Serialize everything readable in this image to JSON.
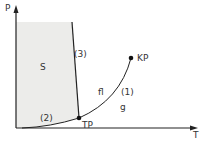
{
  "diagram": {
    "type": "phase diagram",
    "axes": {
      "y_label": "P",
      "x_label": "T"
    },
    "regions": {
      "solid": "S",
      "liquid": "fl",
      "gas": "g"
    },
    "curves": {
      "vaporization": "(1)",
      "sublimation": "(2)",
      "melting": "(3)"
    },
    "points": {
      "triple_point": "TP",
      "critical_point": "KP"
    },
    "colors": {
      "solid_fill": "#ececea",
      "lines": "#222222",
      "text": "#333333"
    }
  }
}
